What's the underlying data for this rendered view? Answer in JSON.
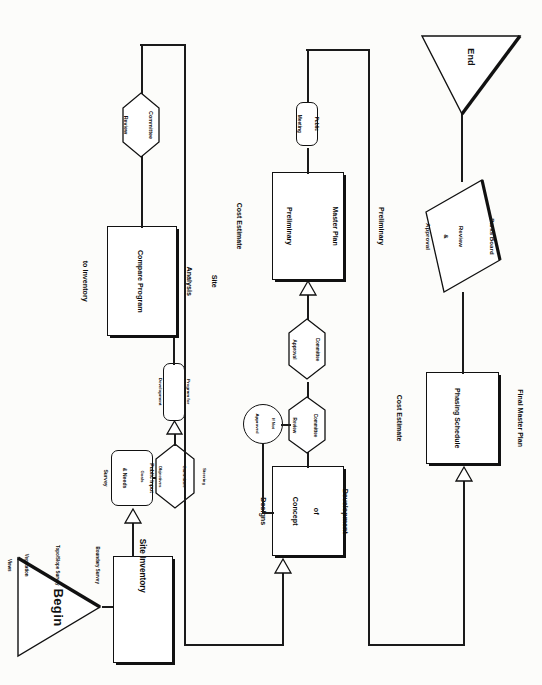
{
  "document": {
    "type": "flowchart",
    "orientation": "rotated-90-landscape-scan",
    "title": "Park Master Plan Process Flowchart",
    "background_color": "#fcfcfa",
    "ink_color": "#111111"
  },
  "nodes": {
    "begin": {
      "label": "Begin",
      "shape": "triangle"
    },
    "site_inventory": {
      "heading": "Site Inventory",
      "shape": "process-box",
      "items": [
        "Boundary Survey",
        "Topo/Slope Survey",
        "Vegetation",
        "Views",
        "Environmental",
        "Cultural",
        "Context",
        "Utility Research",
        "On-Off Site",
        "Zoning",
        "Circulation",
        "Land Use"
      ]
    },
    "public_input": {
      "lines": [
        "Public Input",
        "& Needs",
        "Survey"
      ],
      "shape": "rounded-rect"
    },
    "steering_committee": {
      "lines": [
        "Steering",
        "Committee",
        "Objectives",
        "Goals"
      ],
      "shape": "hexagon"
    },
    "program_for_development": {
      "lines": [
        "Program for",
        "Development"
      ],
      "shape": "rounded-rect"
    },
    "site_analysis": {
      "lines": [
        "Site",
        "Analysis",
        "Compare Program",
        "to Inventory"
      ],
      "shape": "process-box"
    },
    "committee_review_1": {
      "lines": [
        "Committee",
        "Review"
      ],
      "shape": "hexagon"
    },
    "development_concept": {
      "lines": [
        "Development",
        "of",
        "Concept",
        "Designs"
      ],
      "shape": "process-box"
    },
    "committee_review_2": {
      "lines": [
        "Committee",
        "Review"
      ],
      "shape": "hexagon"
    },
    "if_not_approved": {
      "lines": [
        "If Not",
        "Approved"
      ],
      "shape": "circle"
    },
    "committee_approval": {
      "lines": [
        "Committee",
        "Approval"
      ],
      "shape": "hexagon"
    },
    "preliminary_plan": {
      "lines": [
        "Preliminary",
        "Master Plan",
        "Preliminary",
        "Cost Estimate"
      ],
      "shape": "process-box"
    },
    "public_meeting": {
      "lines": [
        "Public",
        "Meeting"
      ],
      "shape": "rounded-rect"
    },
    "final_master_plan": {
      "lines": [
        "Final Master Plan",
        "Phasing Schedule",
        "Cost Estimate"
      ],
      "shape": "process-box"
    },
    "parks_board": {
      "lines": [
        "Parks Board",
        "Review",
        "&",
        "Approval"
      ],
      "shape": "parallelogram"
    },
    "end": {
      "label": "End",
      "shape": "inverted-triangle"
    }
  },
  "flow_sequence": [
    "Begin",
    "Site Inventory",
    "Public Input & Needs Survey",
    "Steering Committee Objectives Goals",
    "Program for Development",
    "Site Analysis Compare Program to Inventory",
    "Committee Review",
    "Development of Concept Designs",
    "Committee Review",
    "Committee Approval",
    "Preliminary Master Plan Preliminary Cost Estimate",
    "Public Meeting",
    "Final Master Plan Phasing Schedule Cost Estimate",
    "Parks Board Review & Approval",
    "End"
  ]
}
